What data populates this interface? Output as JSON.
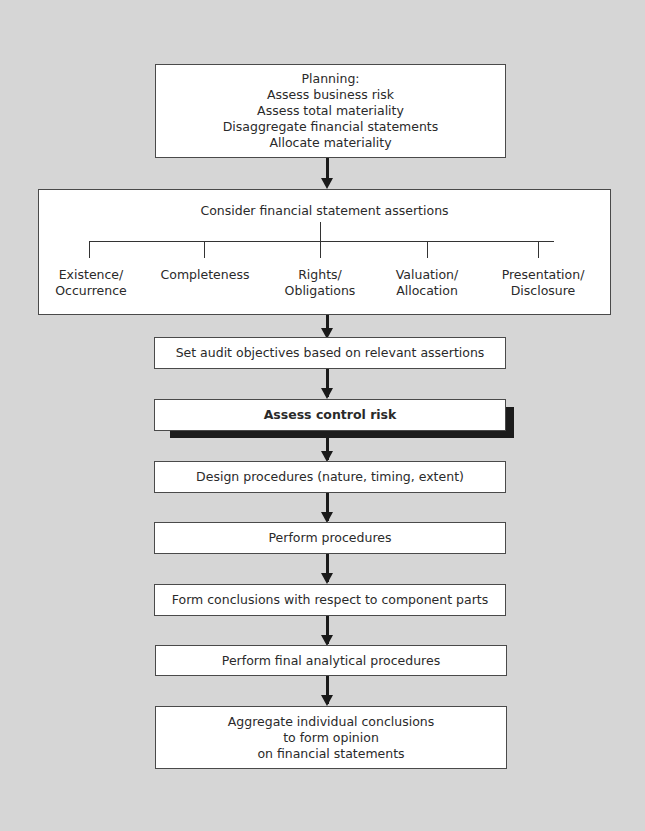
{
  "flowchart": {
    "planning": {
      "lines": [
        "Planning:",
        "Assess business risk",
        "Assess total materiality",
        "Disaggregate financial statements",
        "Allocate materiality"
      ]
    },
    "assertions": {
      "title": "Consider financial statement assertions",
      "items": [
        {
          "line1": "Existence/",
          "line2": "Occurrence"
        },
        {
          "line1": "Completeness",
          "line2": ""
        },
        {
          "line1": "Rights/",
          "line2": "Obligations"
        },
        {
          "line1": "Valuation/",
          "line2": "Allocation"
        },
        {
          "line1": "Presentation/",
          "line2": "Disclosure"
        }
      ]
    },
    "steps": [
      {
        "label": "Set audit objectives based on relevant assertions"
      },
      {
        "label": "Assess control risk",
        "emphasis": true
      },
      {
        "label": "Design procedures (nature, timing, extent)"
      },
      {
        "label": "Perform procedures"
      },
      {
        "label": "Form conclusions with respect to component parts"
      },
      {
        "label": "Perform final analytical procedures"
      }
    ],
    "final": {
      "lines": [
        "Aggregate individual conclusions",
        "to form opinion",
        "on financial statements"
      ]
    }
  },
  "colors": {
    "background": "#d6d6d6",
    "box_fill": "#ffffff",
    "border": "#4a4a4a",
    "shadow": "#1c1c1c"
  }
}
